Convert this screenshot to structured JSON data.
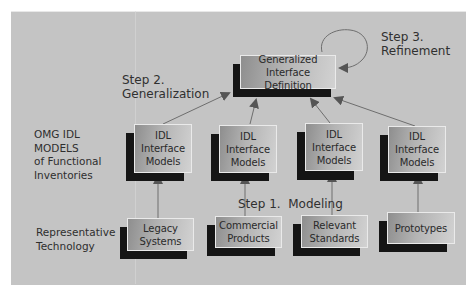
{
  "diagram": {
    "step_labels": {
      "step1": "Step 1.  Modeling",
      "step2_line1": "Step 2.",
      "step2_line2": "Generalization",
      "step3_line1": "Step 3.",
      "step3_line2": "Refinement"
    },
    "row_labels": {
      "models": [
        "OMG IDL",
        "MODELS",
        "of Functional",
        "Inventories"
      ],
      "technology": [
        "Representative",
        "Technology"
      ]
    },
    "top_node": {
      "lines": [
        "Generalized",
        "Interface Definition"
      ]
    },
    "model_nodes": [
      {
        "lines": [
          "IDL",
          "Interface",
          "Models"
        ]
      },
      {
        "lines": [
          "IDL",
          "Interface",
          "Models"
        ]
      },
      {
        "lines": [
          "IDL",
          "Interface",
          "Models"
        ]
      },
      {
        "lines": [
          "IDL",
          "Interface",
          "Models"
        ]
      }
    ],
    "technology_nodes": [
      {
        "lines": [
          "Legacy",
          "Systems"
        ]
      },
      {
        "lines": [
          "Commercial",
          "Products"
        ]
      },
      {
        "lines": [
          "Relevant",
          "Standards"
        ]
      },
      {
        "lines": [
          "Prototypes"
        ]
      }
    ],
    "colors": {
      "background_panel": "#c4c4c4",
      "node_shadow": "#151515",
      "arrow": "#6a6a6a",
      "text": "#2a2a2a"
    }
  }
}
